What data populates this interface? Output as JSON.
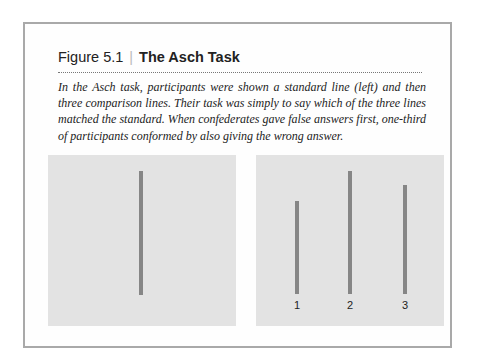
{
  "figure": {
    "number": "Figure 5.1",
    "separator": "|",
    "title": "The Asch Task",
    "caption": "In the Asch task, participants were shown a standard line (left) and then three comparison lines. Their task was simply to say which of the three lines matched the standard. When confederates gave false answers first, one-third of participants conformed by also giving the wrong answer."
  },
  "panels": {
    "standard": {
      "label": "standard line"
    },
    "comparison": {
      "labels": [
        "1",
        "2",
        "3"
      ]
    }
  },
  "colors": {
    "panel_bg": "#e3e3e3",
    "line": "#868686",
    "frame": "#a9a9a9"
  }
}
